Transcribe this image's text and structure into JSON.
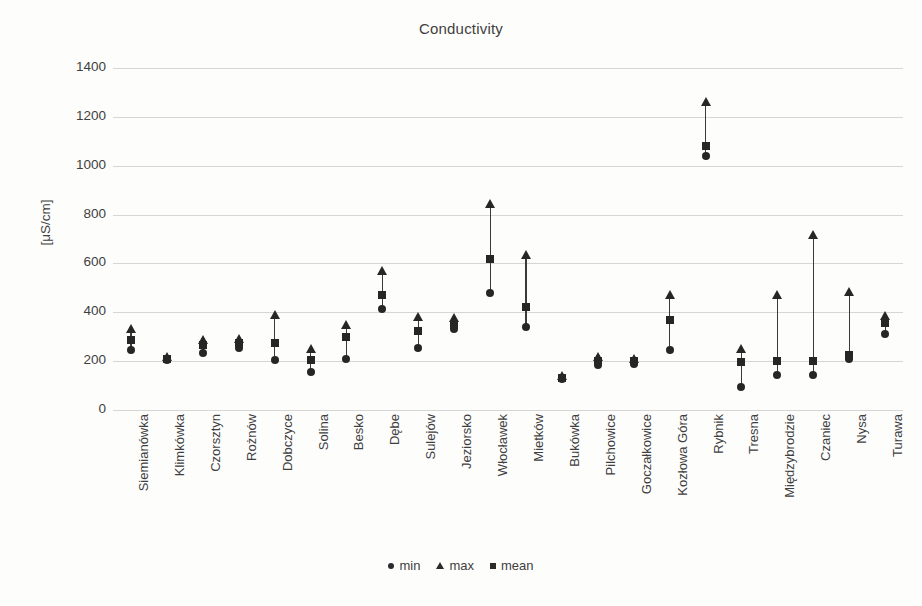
{
  "chart_data": {
    "type": "scatter",
    "title": "Conductivity",
    "xlabel": "",
    "ylabel": "[μS/cm]",
    "ylim": [
      0,
      1400
    ],
    "ytick_step": 200,
    "yticks": [
      1400,
      1200,
      1000,
      800,
      600,
      400,
      200,
      0
    ],
    "grid": true,
    "legend_position": "bottom",
    "categories": [
      "Siemianówka",
      "Klimkówka",
      "Czorsztyn",
      "Rożnów",
      "Dobczyce",
      "Solina",
      "Besko",
      "Dębe",
      "Sulejów",
      "Jeziorsko",
      "Włocławek",
      "Mietków",
      "Bukówka",
      "Pilchowice",
      "Goczałkowice",
      "Kozłowa Góra",
      "Rybnik",
      "Tresna",
      "Międzybrodzie",
      "Czaniec",
      "Nysa",
      "Turawa"
    ],
    "series": [
      {
        "name": "min",
        "marker": "circle",
        "values": [
          245,
          205,
          235,
          255,
          205,
          155,
          210,
          415,
          255,
          330,
          480,
          340,
          128,
          185,
          190,
          245,
          1040,
          95,
          145,
          145,
          210,
          310
        ]
      },
      {
        "name": "max",
        "marker": "triangle",
        "values": [
          330,
          218,
          285,
          290,
          390,
          250,
          350,
          570,
          380,
          375,
          845,
          635,
          140,
          215,
          210,
          470,
          1260,
          250,
          470,
          715,
          485,
          385
        ]
      },
      {
        "name": "mean",
        "marker": "square",
        "values": [
          285,
          210,
          265,
          275,
          275,
          205,
          300,
          470,
          325,
          350,
          620,
          420,
          133,
          200,
          200,
          370,
          1080,
          195,
          200,
          200,
          225,
          355
        ]
      }
    ]
  },
  "legend": {
    "entries": [
      {
        "label": "min",
        "marker": "circle"
      },
      {
        "label": "max",
        "marker": "triangle"
      },
      {
        "label": "mean",
        "marker": "square"
      }
    ]
  }
}
